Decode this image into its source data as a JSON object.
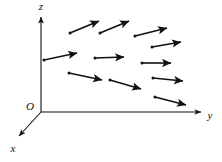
{
  "figure": {
    "width": 222,
    "height": 162,
    "background_color": "#ffffff",
    "ink_color": "#111111"
  },
  "axes": {
    "origin": {
      "x": 41,
      "y": 112,
      "label": "O",
      "label_x": 30,
      "label_y": 110
    },
    "items": [
      {
        "name": "z",
        "label": "z",
        "label_x": 41,
        "label_y": 10,
        "from_x": 41,
        "from_y": 112,
        "to_x": 41,
        "to_y": 17,
        "arrowhead": true
      },
      {
        "name": "y",
        "label": "y",
        "label_x": 210,
        "label_y": 119,
        "from_x": 41,
        "from_y": 112,
        "to_x": 201,
        "to_y": 112,
        "arrowhead": true
      },
      {
        "name": "x",
        "label": "x",
        "label_x": 13,
        "label_y": 152,
        "from_x": 41,
        "from_y": 112,
        "to_x": 19,
        "to_y": 136,
        "arrowhead": true
      }
    ]
  },
  "vector_field": {
    "description": "Twelve arrows representing vectors of a field in the yz-plane region",
    "count": 12,
    "arrow_color": "#111111",
    "arrows": [
      {
        "id": "v1",
        "row": "top",
        "tail_x": 70,
        "tail_y": 33,
        "head_x": 99,
        "head_y": 21
      },
      {
        "id": "v2",
        "row": "top",
        "tail_x": 100,
        "tail_y": 33,
        "head_x": 129,
        "head_y": 21
      },
      {
        "id": "v3",
        "row": "top",
        "tail_x": 135,
        "tail_y": 36,
        "head_x": 167,
        "head_y": 28
      },
      {
        "id": "v4",
        "row": "upper",
        "tail_x": 152,
        "tail_y": 47,
        "head_x": 181,
        "head_y": 42
      },
      {
        "id": "v5",
        "row": "middle",
        "tail_x": 44,
        "tail_y": 60,
        "head_x": 77,
        "head_y": 53
      },
      {
        "id": "v6",
        "row": "middle",
        "tail_x": 95,
        "tail_y": 58,
        "head_x": 124,
        "head_y": 57
      },
      {
        "id": "v7",
        "row": "middle",
        "tail_x": 142,
        "tail_y": 63,
        "head_x": 171,
        "head_y": 63
      },
      {
        "id": "v8",
        "row": "lower",
        "tail_x": 69,
        "tail_y": 73,
        "head_x": 102,
        "head_y": 80
      },
      {
        "id": "v9",
        "row": "lower",
        "tail_x": 110,
        "tail_y": 80,
        "head_x": 141,
        "head_y": 89
      },
      {
        "id": "v10",
        "row": "lower",
        "tail_x": 153,
        "tail_y": 78,
        "head_x": 183,
        "head_y": 81
      },
      {
        "id": "v11",
        "row": "bottom",
        "tail_x": 155,
        "tail_y": 97,
        "head_x": 186,
        "head_y": 105
      },
      {
        "id": "v12",
        "row": "bottom",
        "tail_x": 120,
        "tail_y": 42,
        "head_x": 120,
        "head_y": 42
      }
    ]
  }
}
